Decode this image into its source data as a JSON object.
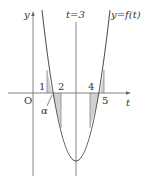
{
  "figure": {
    "type": "function-graph",
    "curve_label": "y=f(t)",
    "symmetry_line_label": "t=3",
    "axes": {
      "x_label": "t",
      "y_label": "y",
      "origin_label": "O"
    },
    "tick_labels": [
      "1",
      "2",
      "4",
      "5"
    ],
    "root_label": "α",
    "colors": {
      "line": "#555555",
      "shade": "#d0d0d0",
      "text": "#333333"
    },
    "shaded_regions": [
      {
        "from": "1",
        "to": "2"
      },
      {
        "from": "4",
        "to": "5"
      }
    ]
  }
}
